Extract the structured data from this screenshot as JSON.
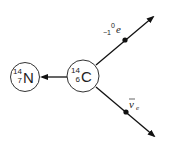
{
  "diagram": {
    "nodes": [
      {
        "id": "nitrogen",
        "symbol": "N",
        "mass_number": "14",
        "atomic_number": "7"
      },
      {
        "id": "carbon",
        "symbol": "C",
        "mass_number": "14",
        "atomic_number": "6"
      }
    ],
    "particles": [
      {
        "id": "electron",
        "symbol": "e",
        "mass_number": "0",
        "charge": "−1"
      },
      {
        "id": "antineutrino",
        "symbol": "ν",
        "subscript": "e",
        "bar": true
      }
    ],
    "edges": [
      {
        "from": "carbon",
        "to": "nitrogen",
        "arrow": true
      },
      {
        "from": "carbon",
        "to": "electron",
        "arrow": true,
        "direction": "up-right"
      },
      {
        "from": "carbon",
        "to": "antineutrino",
        "arrow": true,
        "direction": "down-right"
      }
    ],
    "colors": {
      "line": "#111111",
      "circle_stroke": "#333333",
      "text": "#222222"
    }
  }
}
